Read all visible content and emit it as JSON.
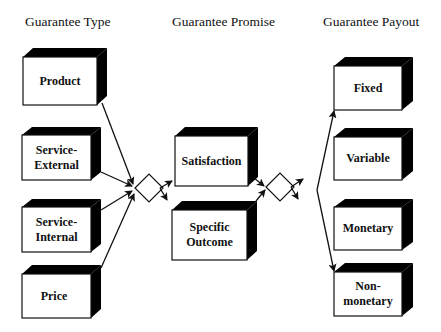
{
  "columns": {
    "type": {
      "title": "Guarantee Type"
    },
    "promise": {
      "title": "Guarantee Promise"
    },
    "payout": {
      "title": "Guarantee Payout"
    }
  },
  "type_boxes": [
    {
      "label": "Product"
    },
    {
      "label": "Service-\nExternal"
    },
    {
      "label": "Service-\nInternal"
    },
    {
      "label": "Price"
    }
  ],
  "promise_boxes": [
    {
      "label": "Satisfaction"
    },
    {
      "label": "Specific\nOutcome"
    }
  ],
  "payout_boxes": [
    {
      "label": "Fixed"
    },
    {
      "label": "Variable"
    },
    {
      "label": "Monetary"
    },
    {
      "label": "Non-\nmonetary"
    }
  ],
  "connectors": [
    {
      "name": "diamond-1",
      "shape": "diamond"
    },
    {
      "name": "diamond-2",
      "shape": "diamond"
    }
  ],
  "colors": {
    "line": "#111111",
    "fill": "#ffffff",
    "shade": "#000000"
  }
}
